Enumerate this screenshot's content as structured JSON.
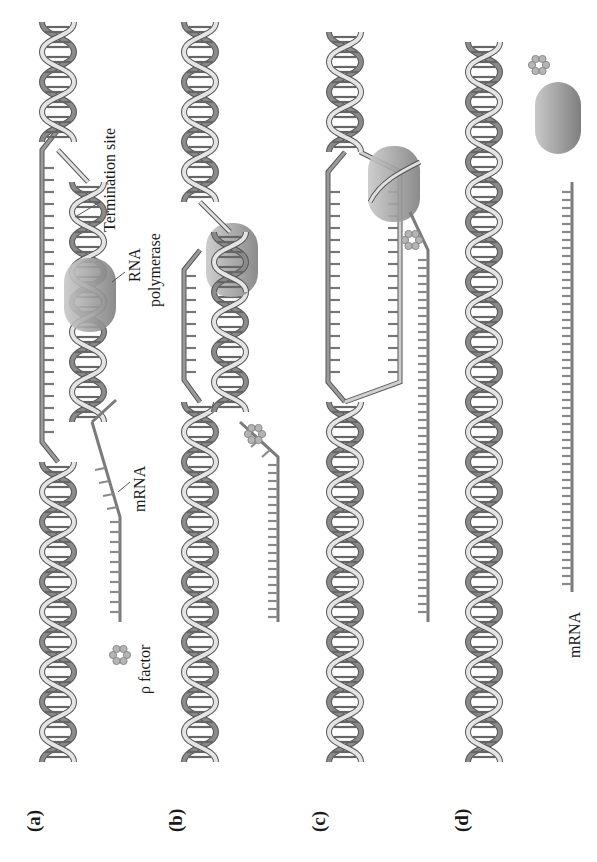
{
  "figure": {
    "panels": [
      {
        "id": "a",
        "label": "(a)"
      },
      {
        "id": "b",
        "label": "(b)"
      },
      {
        "id": "c",
        "label": "(c)"
      },
      {
        "id": "d",
        "label": "(d)"
      }
    ],
    "labels": {
      "termination_site": "Termination site",
      "rna": "RNA",
      "polymerase": "polymerase",
      "mrna_a": "mRNA",
      "rho_factor": "ρ factor",
      "mrna_d": "mRNA"
    },
    "colors": {
      "dna_light": "#e2e2e2",
      "dna_dark": "#8a8a8a",
      "outline": "#555555",
      "polymerase": "#9c9c9c",
      "rho": "#b3b3b3",
      "mrna": "#8f8f8f"
    }
  }
}
